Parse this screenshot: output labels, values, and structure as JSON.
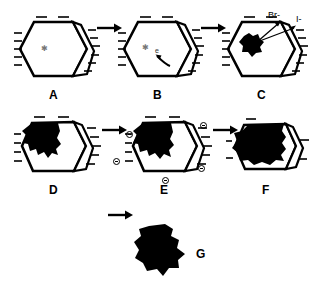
{
  "figure": {
    "background_color": "#ffffff",
    "ink_color": "#000000",
    "width": 311,
    "height": 286
  },
  "panels": [
    {
      "id": "A",
      "label": "A",
      "row": 1,
      "description": "Hexagonal silver halide crystal with surface sensitivity speck, dashes around perimeter",
      "has_star": true,
      "star_glyph": "✳",
      "dark_fraction": 0.0
    },
    {
      "id": "B",
      "label": "B",
      "row": 1,
      "description": "Crystal with sensitivity speck plus free electron migrating toward it along curved arrow",
      "has_star": true,
      "star_glyph": "✳",
      "electron_label": "e",
      "dark_fraction": 0.0
    },
    {
      "id": "C",
      "label": "C",
      "row": 1,
      "description": "Silver speck formed; halide ions released to surface",
      "dark_fraction": 0.12,
      "ion_labels": [
        "Br-",
        "I-"
      ]
    },
    {
      "id": "D",
      "label": "D",
      "row": 2,
      "description": "Growing silver region in upper left of crystal",
      "dark_fraction": 0.3
    },
    {
      "id": "E",
      "label": "E",
      "row": 2,
      "description": "Silver region grows, surrounded by negative charges",
      "dark_fraction": 0.35,
      "charges": [
        "⊖",
        "⊖",
        "⊖",
        "⊖"
      ]
    },
    {
      "id": "F",
      "label": "F",
      "row": 2,
      "description": "Silver region occupies most of the crystal",
      "dark_fraction": 0.75
    },
    {
      "id": "G",
      "label": "G",
      "row": 3,
      "description": "Fully developed silver grain, solid black",
      "dark_fraction": 1.0
    }
  ],
  "arrows": [
    {
      "id": "arrow-a-b",
      "from": "A",
      "to": "B"
    },
    {
      "id": "arrow-b-c",
      "from": "B",
      "to": "C"
    },
    {
      "id": "arrow-d-e",
      "from": "D",
      "to": "E"
    },
    {
      "id": "arrow-e-f",
      "from": "E",
      "to": "F"
    },
    {
      "id": "arrow-f-g",
      "from": "F",
      "to": "G"
    }
  ],
  "annotations": {
    "bromide_ion": "Br-",
    "iodide_ion": "I-",
    "electron": "e",
    "negative_charge": "⊖"
  }
}
